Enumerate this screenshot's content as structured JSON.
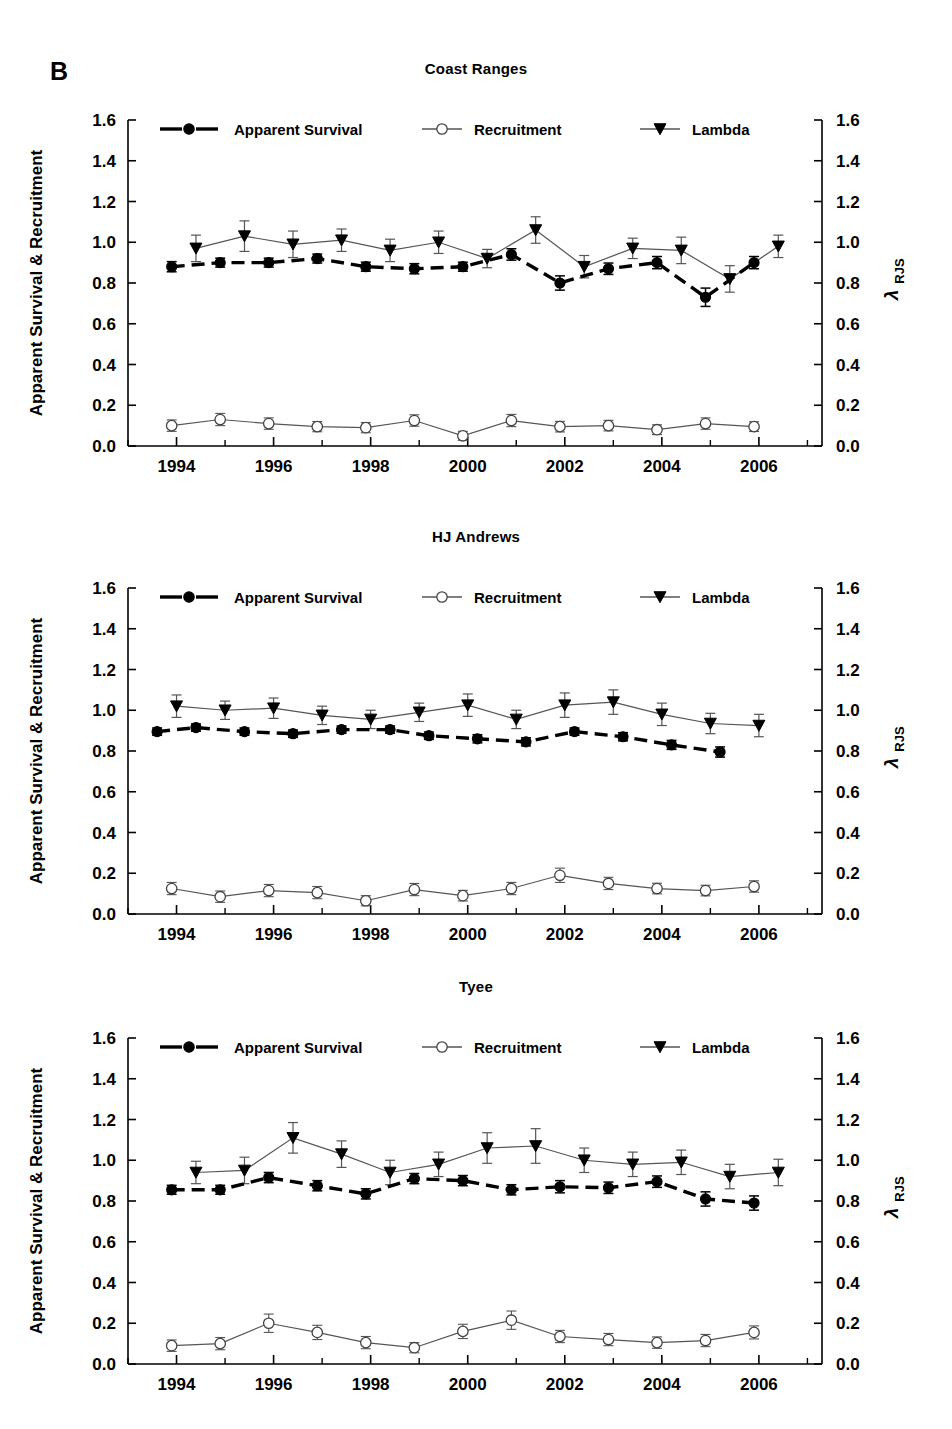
{
  "figure": {
    "label": "B",
    "left_axis_title": "Apparent Survival & Recruitment",
    "right_axis_title_main": "λ",
    "right_axis_title_sub": "RJS",
    "x_axis_title": "Year"
  },
  "legend": {
    "items": [
      {
        "label": "Apparent Survival",
        "marker": "filled-circle-dashed-line",
        "color": "#000000"
      },
      {
        "label": "Recruitment",
        "marker": "open-circle-solid-line",
        "color": "#000000"
      },
      {
        "label": "Lambda",
        "marker": "filled-triangle-down-solid-line",
        "color": "#000000"
      }
    ]
  },
  "axes": {
    "y_ticks": [
      "0.0",
      "0.2",
      "0.4",
      "0.6",
      "0.8",
      "1.0",
      "1.2",
      "1.4",
      "1.6"
    ],
    "y_values": [
      0.0,
      0.2,
      0.4,
      0.6,
      0.8,
      1.0,
      1.2,
      1.4,
      1.6
    ],
    "ylim": [
      0.0,
      1.6
    ],
    "x_ticks_labeled": [
      "1994",
      "1996",
      "1998",
      "2000",
      "2002",
      "2004",
      "2006"
    ],
    "x_tick_values": [
      1994,
      1996,
      1998,
      2000,
      2002,
      2004,
      2006
    ],
    "x_minor_values": [
      1993,
      1995,
      1997,
      1999,
      2001,
      2003,
      2005,
      2007
    ],
    "xlim": [
      1993.0,
      2007.3
    ],
    "grid": false,
    "legend_position": "top-inside"
  },
  "chart_data": [
    {
      "type": "line",
      "title": "Coast Ranges",
      "xlabel": "Year",
      "ylabel": "Apparent Survival & Recruitment",
      "ylabel_right": "λ RJS",
      "ylim": [
        0.0,
        1.6
      ],
      "xlim": [
        1993.0,
        2007.3
      ],
      "series": [
        {
          "name": "Apparent Survival",
          "x": [
            1993.9,
            1994.9,
            1995.9,
            1996.9,
            1997.9,
            1998.9,
            1999.9,
            2000.9,
            2001.9,
            2002.9,
            2003.9,
            2004.9,
            2005.9,
            2006.9
          ],
          "values": [
            0.88,
            0.9,
            0.9,
            0.92,
            0.88,
            0.87,
            0.88,
            0.94,
            0.8,
            0.87,
            0.9,
            0.73,
            0.9,
            null
          ],
          "err_low": [
            0.025,
            0.022,
            0.022,
            0.022,
            0.022,
            0.025,
            0.022,
            0.028,
            0.035,
            0.028,
            0.03,
            0.045,
            0.03,
            null
          ],
          "err_high": [
            0.025,
            0.022,
            0.022,
            0.022,
            0.022,
            0.025,
            0.022,
            0.028,
            0.035,
            0.028,
            0.03,
            0.045,
            0.03,
            null
          ]
        },
        {
          "name": "Recruitment",
          "x": [
            1993.9,
            1994.9,
            1995.9,
            1996.9,
            1997.9,
            1998.9,
            1999.9,
            2000.9,
            2001.9,
            2002.9,
            2003.9,
            2004.9,
            2005.9,
            2006.9
          ],
          "values": [
            0.1,
            0.13,
            0.11,
            0.095,
            0.09,
            0.125,
            0.05,
            0.125,
            0.095,
            0.1,
            0.08,
            0.11,
            0.095,
            null
          ],
          "err_low": [
            0.028,
            0.03,
            0.028,
            0.025,
            0.025,
            0.028,
            0.022,
            0.03,
            0.026,
            0.026,
            0.024,
            0.028,
            0.024,
            null
          ],
          "err_high": [
            0.028,
            0.03,
            0.028,
            0.025,
            0.025,
            0.028,
            0.022,
            0.03,
            0.026,
            0.026,
            0.024,
            0.028,
            0.024,
            null
          ]
        },
        {
          "name": "Lambda",
          "x": [
            1994.4,
            1995.4,
            1996.4,
            1997.4,
            1998.4,
            1999.4,
            2000.4,
            2001.4,
            2002.4,
            2003.4,
            2004.4,
            2005.4,
            2006.4,
            2007.0
          ],
          "values": [
            0.97,
            1.03,
            0.99,
            1.01,
            0.96,
            1.0,
            0.92,
            1.06,
            0.88,
            0.97,
            0.96,
            0.82,
            0.98,
            null
          ],
          "err_low": [
            0.065,
            0.075,
            0.065,
            0.055,
            0.055,
            0.055,
            0.045,
            0.065,
            0.055,
            0.05,
            0.065,
            0.065,
            0.055,
            null
          ],
          "err_high": [
            0.065,
            0.075,
            0.065,
            0.055,
            0.055,
            0.055,
            0.045,
            0.065,
            0.055,
            0.05,
            0.065,
            0.065,
            0.055,
            null
          ]
        }
      ]
    },
    {
      "type": "line",
      "title": "HJ Andrews",
      "xlabel": "Year",
      "ylabel": "Apparent Survival & Recruitment",
      "ylabel_right": "λ RJS",
      "ylim": [
        0.0,
        1.6
      ],
      "xlim": [
        1993.0,
        2007.3
      ],
      "series": [
        {
          "name": "Apparent Survival",
          "x": [
            1993.6,
            1994.4,
            1995.4,
            1996.4,
            1997.4,
            1998.4,
            1999.2,
            2000.2,
            2001.2,
            2002.2,
            2003.2,
            2004.2,
            2005.2,
            2006.2
          ],
          "values": [
            0.895,
            0.915,
            0.895,
            0.885,
            0.905,
            0.905,
            0.875,
            0.86,
            0.845,
            0.895,
            0.87,
            0.83,
            0.795,
            null
          ],
          "err_low": [
            0.018,
            0.018,
            0.018,
            0.018,
            0.018,
            0.018,
            0.018,
            0.02,
            0.02,
            0.018,
            0.02,
            0.022,
            0.025,
            null
          ],
          "err_high": [
            0.018,
            0.018,
            0.018,
            0.018,
            0.018,
            0.018,
            0.018,
            0.02,
            0.02,
            0.018,
            0.02,
            0.022,
            0.025,
            null
          ]
        },
        {
          "name": "Recruitment",
          "x": [
            1993.9,
            1994.9,
            1995.9,
            1996.9,
            1997.9,
            1998.9,
            1999.9,
            2000.9,
            2001.9,
            2002.9,
            2003.9,
            2004.9,
            2005.9,
            2006.9
          ],
          "values": [
            0.125,
            0.085,
            0.115,
            0.105,
            0.065,
            0.12,
            0.09,
            0.125,
            0.19,
            0.15,
            0.125,
            0.115,
            0.135,
            null
          ],
          "err_low": [
            0.03,
            0.028,
            0.03,
            0.03,
            0.025,
            0.03,
            0.026,
            0.03,
            0.035,
            0.03,
            0.026,
            0.026,
            0.028,
            null
          ],
          "err_high": [
            0.03,
            0.028,
            0.03,
            0.03,
            0.025,
            0.03,
            0.026,
            0.03,
            0.035,
            0.03,
            0.026,
            0.026,
            0.028,
            null
          ]
        },
        {
          "name": "Lambda",
          "x": [
            1994.0,
            1995.0,
            1996.0,
            1997.0,
            1998.0,
            1999.0,
            2000.0,
            2001.0,
            2002.0,
            2003.0,
            2004.0,
            2005.0,
            2006.0,
            2006.9
          ],
          "values": [
            1.02,
            1.0,
            1.01,
            0.975,
            0.955,
            0.99,
            1.025,
            0.955,
            1.025,
            1.04,
            0.98,
            0.935,
            0.925,
            null
          ],
          "err_low": [
            0.055,
            0.045,
            0.05,
            0.045,
            0.045,
            0.045,
            0.055,
            0.045,
            0.06,
            0.06,
            0.055,
            0.05,
            0.055,
            null
          ],
          "err_high": [
            0.055,
            0.045,
            0.05,
            0.045,
            0.045,
            0.045,
            0.055,
            0.045,
            0.06,
            0.06,
            0.055,
            0.05,
            0.055,
            null
          ]
        }
      ]
    },
    {
      "type": "line",
      "title": "Tyee",
      "xlabel": "Year",
      "ylabel": "Apparent Survival & Recruitment",
      "ylabel_right": "λ RJS",
      "ylim": [
        0.0,
        1.6
      ],
      "xlim": [
        1993.0,
        2007.3
      ],
      "series": [
        {
          "name": "Apparent Survival",
          "x": [
            1993.9,
            1994.9,
            1995.9,
            1996.9,
            1997.9,
            1998.9,
            1999.9,
            2000.9,
            2001.9,
            2002.9,
            2003.9,
            2004.9,
            2005.9,
            2006.9
          ],
          "values": [
            0.855,
            0.855,
            0.915,
            0.875,
            0.835,
            0.91,
            0.9,
            0.855,
            0.87,
            0.865,
            0.895,
            0.81,
            0.79,
            null
          ],
          "err_low": [
            0.022,
            0.022,
            0.025,
            0.025,
            0.025,
            0.025,
            0.025,
            0.025,
            0.03,
            0.028,
            0.028,
            0.035,
            0.035,
            null
          ],
          "err_high": [
            0.022,
            0.022,
            0.025,
            0.025,
            0.025,
            0.025,
            0.025,
            0.025,
            0.03,
            0.028,
            0.028,
            0.035,
            0.035,
            null
          ]
        },
        {
          "name": "Recruitment",
          "x": [
            1993.9,
            1994.9,
            1995.9,
            1996.9,
            1997.9,
            1998.9,
            1999.9,
            2000.9,
            2001.9,
            2002.9,
            2003.9,
            2004.9,
            2005.9,
            2006.9
          ],
          "values": [
            0.09,
            0.1,
            0.2,
            0.155,
            0.105,
            0.08,
            0.16,
            0.215,
            0.135,
            0.12,
            0.105,
            0.115,
            0.155,
            null
          ],
          "err_low": [
            0.028,
            0.03,
            0.045,
            0.035,
            0.03,
            0.025,
            0.035,
            0.045,
            0.03,
            0.03,
            0.028,
            0.03,
            0.032,
            null
          ],
          "err_high": [
            0.028,
            0.03,
            0.045,
            0.035,
            0.03,
            0.025,
            0.035,
            0.045,
            0.03,
            0.03,
            0.028,
            0.03,
            0.032,
            null
          ]
        },
        {
          "name": "Lambda",
          "x": [
            1994.4,
            1995.4,
            1996.4,
            1997.4,
            1998.4,
            1999.4,
            2000.4,
            2001.4,
            2002.4,
            2003.4,
            2004.4,
            2005.4,
            2006.4,
            2007.0
          ],
          "values": [
            0.94,
            0.95,
            1.11,
            1.03,
            0.94,
            0.98,
            1.06,
            1.07,
            1.0,
            0.98,
            0.99,
            0.92,
            0.94,
            null
          ],
          "err_low": [
            0.055,
            0.065,
            0.075,
            0.065,
            0.06,
            0.06,
            0.075,
            0.085,
            0.06,
            0.06,
            0.06,
            0.06,
            0.065,
            null
          ],
          "err_high": [
            0.055,
            0.065,
            0.075,
            0.065,
            0.06,
            0.06,
            0.075,
            0.085,
            0.06,
            0.06,
            0.06,
            0.06,
            0.065,
            null
          ]
        }
      ]
    }
  ]
}
